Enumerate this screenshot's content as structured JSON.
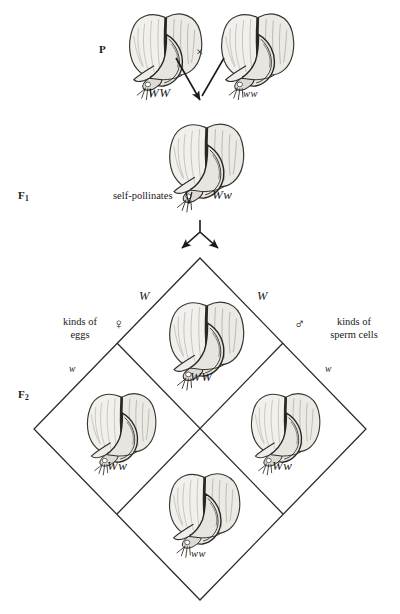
{
  "diagram": {
    "type": "punnett-square-monohybrid-cross",
    "generations": [
      {
        "key": "P",
        "label": "P",
        "label_base": "P",
        "subscript": ""
      },
      {
        "key": "F1",
        "label": "F1",
        "label_base": "F",
        "subscript": "1"
      },
      {
        "key": "F2",
        "label": "F2",
        "label_base": "F",
        "subscript": "2"
      }
    ]
  },
  "parental": {
    "left_genotype": "WW",
    "right_genotype": "ww",
    "cross_symbol": "×",
    "flower_icon": "pea-flower-icon"
  },
  "f1": {
    "genotype": "Ww",
    "note": "self-pollinates",
    "flower_icon": "pea-flower-icon"
  },
  "gametes": {
    "female_label_line1": "kinds of",
    "female_label_line2": "eggs",
    "female_symbol": "♀",
    "male_label_line1": "kinds of",
    "male_label_line2": "sperm cells",
    "male_symbol": "♂",
    "egg_alleles": [
      "W",
      "w"
    ],
    "sperm_alleles": [
      "W",
      "w"
    ]
  },
  "f2": {
    "cells": [
      {
        "position": "top",
        "genotype": "WW",
        "flower_icon": "pea-flower-icon"
      },
      {
        "position": "left",
        "genotype": "Ww",
        "flower_icon": "pea-flower-icon"
      },
      {
        "position": "right",
        "genotype": "Ww",
        "flower_icon": "pea-flower-icon"
      },
      {
        "position": "bottom",
        "genotype": "ww",
        "flower_icon": "pea-flower-icon"
      }
    ],
    "edge_labels": {
      "upper_left": "W",
      "upper_right": "W",
      "lower_left": "w",
      "lower_right": "w"
    }
  },
  "colors": {
    "ink": "#1a1a1a",
    "line": "#2b2b2b",
    "background": "#ffffff",
    "petal_light": "#f0eeea",
    "petal_shade": "#b9b5ad",
    "petal_dark": "#5a564f"
  }
}
